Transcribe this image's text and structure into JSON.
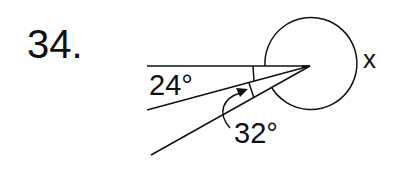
{
  "problem": {
    "number": "34."
  },
  "diagram": {
    "labels": {
      "angle_a": "24°",
      "angle_b": "32°",
      "unknown": "x"
    },
    "stroke_color": "#111111",
    "background": "#ffffff"
  }
}
